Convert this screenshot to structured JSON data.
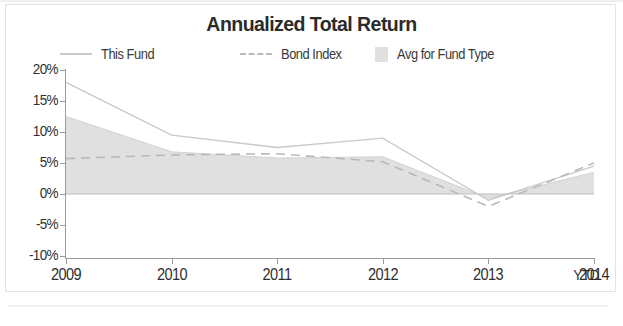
{
  "title": "Annualized Total Return",
  "legend": {
    "position": "top",
    "items": [
      {
        "label": "This Fund",
        "marker": "solid-line-icon",
        "color": "#c9c9c9"
      },
      {
        "label": "Bond Index",
        "marker": "dashed-line-icon",
        "color": "#b9b9b9"
      },
      {
        "label": "Avg for Fund Type",
        "marker": "area-swatch-icon",
        "color": "#e0e0e0"
      }
    ]
  },
  "axes": {
    "y_ticks": [
      "20%",
      "15%",
      "10%",
      "5%",
      "0%",
      "-5%",
      "-10%"
    ],
    "x_ticks": [
      "2009",
      "2010",
      "2011",
      "2012",
      "2013",
      "2014"
    ],
    "x_suffix": "YTD"
  },
  "chart_data": {
    "type": "line",
    "title": "Annualized Total Return",
    "xlabel": "",
    "ylabel": "",
    "categories": [
      "2009",
      "2010",
      "2011",
      "2012",
      "2013",
      "2014 YTD"
    ],
    "ylim": [
      -10,
      20
    ],
    "ytick_values": [
      20,
      15,
      10,
      5,
      0,
      -5,
      -10
    ],
    "ytick_labels": [
      "20%",
      "15%",
      "10%",
      "5%",
      "0%",
      "-5%",
      "-10%"
    ],
    "grid": false,
    "legend_position": "top",
    "series": [
      {
        "name": "This Fund",
        "style": "solid",
        "color": "#c9c9c9",
        "values": [
          18.0,
          9.5,
          7.5,
          9.0,
          -1.0,
          4.5
        ]
      },
      {
        "name": "Bond Index",
        "style": "dashed",
        "color": "#b9b9b9",
        "values": [
          5.7,
          6.3,
          6.5,
          5.2,
          -2.0,
          5.0
        ]
      },
      {
        "name": "Avg for Fund Type",
        "style": "area",
        "color": "#e0e0e0",
        "values": [
          12.5,
          6.8,
          5.8,
          6.0,
          -0.7,
          3.5
        ]
      }
    ]
  }
}
